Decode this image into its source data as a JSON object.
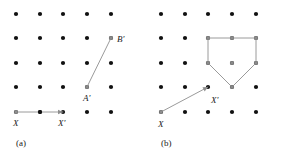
{
  "figure": {
    "width": 290,
    "height": 158,
    "background": "#ffffff",
    "grid": {
      "columns": 5,
      "rows": 5,
      "dot_color": "#111111",
      "dot_radius": 2.1,
      "col_x": [
        16,
        40,
        63,
        87,
        111
      ],
      "row_y": [
        14,
        38,
        63,
        87,
        112
      ]
    },
    "accent_color": "#8e8e8e",
    "vertex_color": "#8a8a8a",
    "text_color": "#1a1a1a"
  },
  "panels": [
    {
      "id": "a",
      "caption": "(a)",
      "caption_x": 16,
      "caption_y": 138,
      "arrow": {
        "name": "translation-vector-x-to-xprime",
        "x1": 16,
        "y1": 112,
        "x2": 63,
        "y2": 112,
        "tail_label": "X",
        "head_label": "X'",
        "tail_label_x": 13,
        "tail_label_y": 118,
        "head_label_x": 58,
        "head_label_y": 118,
        "midpoint_dot": {
          "x": 40,
          "y": 112
        }
      },
      "segment": {
        "name": "segment-aprime-bprime",
        "x1": 87,
        "y1": 87,
        "x2": 111,
        "y2": 38,
        "start_label": "A'",
        "end_label": "B'",
        "start_label_x": 83,
        "start_label_y": 93,
        "end_label_x": 117,
        "end_label_y": 34
      }
    },
    {
      "id": "b",
      "caption": "(b)",
      "caption_x": 16,
      "caption_y": 138,
      "arrow": {
        "name": "translation-vector-x-to-xprime",
        "x1": 16,
        "y1": 112,
        "x2": 63,
        "y2": 87,
        "tail_label": "X",
        "head_label": "X'",
        "tail_label_x": 13,
        "tail_label_y": 119,
        "head_label_x": 66,
        "head_label_y": 95
      },
      "polygon": {
        "name": "translated-pentagon",
        "vertices": [
          {
            "x": 63,
            "y": 38
          },
          {
            "x": 87,
            "y": 38
          },
          {
            "x": 111,
            "y": 38
          },
          {
            "x": 111,
            "y": 63
          },
          {
            "x": 87,
            "y": 87
          },
          {
            "x": 63,
            "y": 63
          }
        ],
        "interior_point": {
          "x": 87,
          "y": 63
        }
      }
    }
  ]
}
